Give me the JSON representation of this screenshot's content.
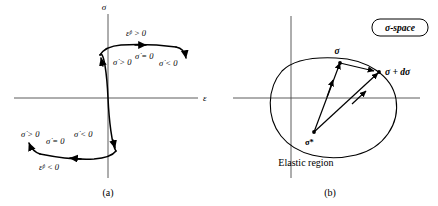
{
  "figure": {
    "panels": [
      {
        "caption": "(a)",
        "type": "stress-strain-curve",
        "axes": {
          "y_label": "σ",
          "x_label": "ε"
        },
        "annotations": {
          "upper_plastic": "ε̇ᵖ > 0",
          "lower_plastic": "ε̇ᵖ < 0",
          "upper_rising": "σ̇ > 0",
          "upper_flat": "σ̇ = 0",
          "upper_falling": "σ̇ < 0",
          "lower_left": "σ̇ > 0",
          "lower_flat": "σ̇ = 0",
          "lower_right": "σ̇ < 0"
        }
      },
      {
        "caption": "(b)",
        "type": "yield-surface-sigma-space",
        "badge": "σ-space",
        "region_label": "Elastic region",
        "points": {
          "sigma": "σ",
          "sigma_plus_dsigma": "σ + dσ",
          "sigma_star": "σ*"
        }
      }
    ]
  },
  "colors": {
    "background": "#ffffff",
    "ink": "#000000",
    "axis": "#4a4a4a"
  }
}
